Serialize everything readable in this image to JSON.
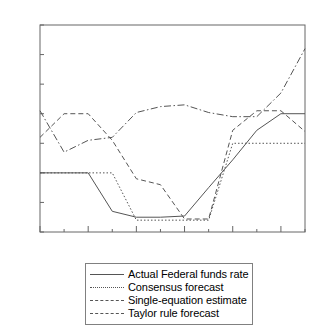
{
  "chart_data": {
    "type": "line",
    "title": "",
    "xlabel": "",
    "ylabel": "",
    "ylim": [
      4.5,
      8.0
    ],
    "yticks": [
      "4.5",
      "5.0",
      "5.5",
      "6.0",
      "6.5",
      "7.0",
      "7.5",
      "8.0"
    ],
    "ytick_values": [
      4.5,
      5.0,
      5.5,
      6.0,
      6.5,
      7.0,
      7.5,
      8.0
    ],
    "grid": false,
    "legend_position": "below-center",
    "x": [
      "98:1",
      "98:2",
      "98:3",
      "98:4",
      "99:1",
      "99:2",
      "99:3",
      "99:4",
      "00:1",
      "00:2",
      "00:3",
      "00:4"
    ],
    "xticks_labeled": [
      "98:1",
      "98:3",
      "99:1",
      "99:3",
      "00:1",
      "00:3"
    ],
    "xtick_label_indices": [
      0,
      2,
      4,
      6,
      8,
      10
    ],
    "series": [
      {
        "name": "Actual Federal funds rate",
        "style": "solid",
        "values": [
          5.5,
          5.5,
          5.5,
          4.85,
          4.75,
          4.75,
          4.77,
          5.25,
          5.72,
          6.22,
          6.5,
          6.5
        ]
      },
      {
        "name": "Consensus forecast",
        "style": "dotted",
        "values": [
          5.5,
          5.5,
          5.5,
          5.5,
          4.7,
          4.7,
          4.7,
          4.7,
          6.0,
          6.0,
          6.0,
          6.0
        ]
      },
      {
        "name": "Single-equation estimate",
        "style": "dashed",
        "values": [
          6.1,
          6.5,
          6.5,
          6.05,
          5.4,
          5.3,
          4.72,
          4.72,
          6.22,
          6.55,
          6.55,
          6.2
        ]
      },
      {
        "name": "Taylor rule forecast",
        "style": "dashdot",
        "values": [
          6.55,
          5.85,
          6.05,
          6.1,
          6.52,
          6.62,
          6.65,
          6.52,
          6.45,
          6.45,
          6.85,
          7.6
        ]
      }
    ],
    "legend_entries": [
      {
        "label": "Actual Federal funds rate",
        "style": "solid"
      },
      {
        "label": "Consensus forecast",
        "style": "dotted"
      },
      {
        "label": "Single-equation estimate",
        "style": "dashed"
      },
      {
        "label": "Taylor rule forecast",
        "style": "dashdot"
      }
    ]
  }
}
